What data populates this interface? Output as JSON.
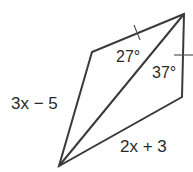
{
  "figure": {
    "type": "quadrilateral-with-diagonal",
    "vertices": {
      "top_right": [
        184,
        14
      ],
      "left": [
        92,
        52
      ],
      "bottom": [
        59,
        166
      ],
      "right": [
        182,
        97
      ]
    },
    "labels": {
      "side_left": "3x − 5",
      "side_bottom": "2x + 3",
      "angle_top": "27°",
      "angle_right": "37°"
    },
    "colors": {
      "stroke": "#3a3a3a",
      "text": "#2a2a2a",
      "background": "#ffffff"
    }
  }
}
